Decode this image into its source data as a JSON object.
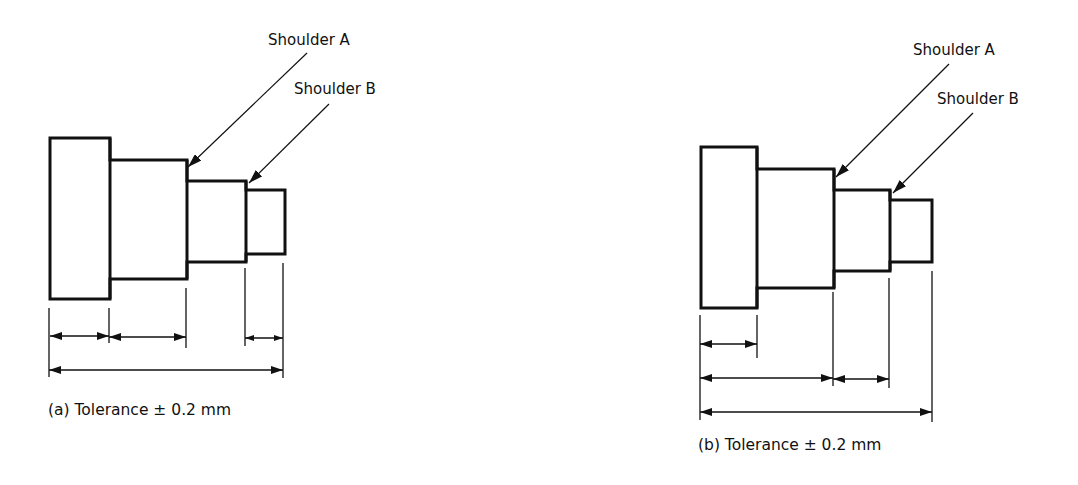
{
  "figures": [
    {
      "id": "a",
      "caption": "(a) Tolerance ± 0.2 mm",
      "caption_pos": [
        48,
        415
      ],
      "labels": [
        {
          "text": "Shoulder A",
          "x": 268,
          "y": 45
        },
        {
          "text": "Shoulder B",
          "x": 294,
          "y": 94
        }
      ],
      "leaders": [
        {
          "x1": 307,
          "y1": 53,
          "x2": 188,
          "y2": 167
        },
        {
          "x1": 329,
          "y1": 104,
          "x2": 249,
          "y2": 183
        }
      ],
      "steps": [
        {
          "x1": 50,
          "x2": 110,
          "y1": 138,
          "y2": 299
        },
        {
          "x1": 110,
          "x2": 187,
          "y1": 160,
          "y2": 279
        },
        {
          "x1": 187,
          "x2": 246,
          "y1": 181,
          "y2": 262
        },
        {
          "x1": 246,
          "x2": 285,
          "y1": 190,
          "y2": 254
        }
      ],
      "extension_lines": [
        {
          "x": 49,
          "y1": 308,
          "y2": 377
        },
        {
          "x": 109,
          "y1": 308,
          "y2": 343
        },
        {
          "x": 186,
          "y1": 288,
          "y2": 348
        },
        {
          "x": 245,
          "y1": 268,
          "y2": 346
        },
        {
          "x": 283,
          "y1": 263,
          "y2": 378
        }
      ],
      "dimensions": [
        {
          "x1": 50,
          "x2": 109,
          "y": 336
        },
        {
          "x1": 109,
          "x2": 186,
          "y": 337
        },
        {
          "x1": 245,
          "x2": 283,
          "y": 338,
          "small": true
        },
        {
          "x1": 49,
          "x2": 283,
          "y": 370
        }
      ]
    },
    {
      "id": "b",
      "caption": "(b) Tolerance ± 0.2 mm",
      "caption_pos": [
        698,
        450
      ],
      "labels": [
        {
          "text": "Shoulder A",
          "x": 913,
          "y": 55
        },
        {
          "text": "Shoulder B",
          "x": 937,
          "y": 104
        }
      ],
      "leaders": [
        {
          "x1": 949,
          "y1": 64,
          "x2": 836,
          "y2": 177
        },
        {
          "x1": 973,
          "y1": 113,
          "x2": 893,
          "y2": 193
        }
      ],
      "steps": [
        {
          "x1": 701,
          "x2": 757,
          "y1": 147,
          "y2": 308
        },
        {
          "x1": 757,
          "x2": 834,
          "y1": 169,
          "y2": 288
        },
        {
          "x1": 834,
          "x2": 890,
          "y1": 190,
          "y2": 271
        },
        {
          "x1": 890,
          "x2": 932,
          "y1": 200,
          "y2": 262
        }
      ],
      "extension_lines": [
        {
          "x": 700,
          "y1": 315,
          "y2": 420
        },
        {
          "x": 757,
          "y1": 315,
          "y2": 358
        },
        {
          "x": 833,
          "y1": 292,
          "y2": 386
        },
        {
          "x": 889,
          "y1": 278,
          "y2": 388
        },
        {
          "x": 932,
          "y1": 271,
          "y2": 422
        }
      ],
      "dimensions": [
        {
          "x1": 700,
          "x2": 757,
          "y": 344
        },
        {
          "x1": 700,
          "x2": 833,
          "y": 378
        },
        {
          "x1": 833,
          "x2": 889,
          "y": 379
        },
        {
          "x1": 700,
          "x2": 932,
          "y": 412
        }
      ]
    }
  ]
}
